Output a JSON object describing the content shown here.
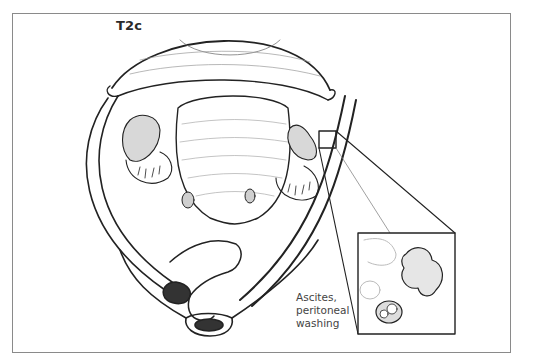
{
  "figure": {
    "stage_label": "T2c",
    "callout": {
      "lines": [
        "Ascites,",
        "peritoneal",
        "washing"
      ]
    }
  }
}
